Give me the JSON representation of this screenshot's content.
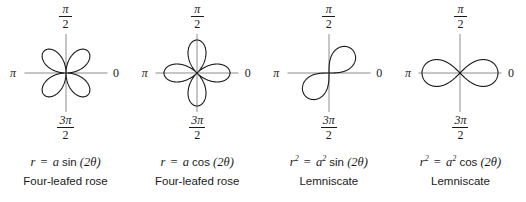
{
  "figure": {
    "axis_color": "#8c8c8c",
    "curve_color": "#1a1a1a",
    "background": "#ffffff"
  },
  "labels": {
    "top_numerator": "π",
    "top_denominator": "2",
    "bottom_numerator": "3π",
    "bottom_denominator": "2",
    "left": "π",
    "right": "0"
  },
  "panels": [
    {
      "id": "four-leafed-rose-sin",
      "equation": {
        "lhs": "r",
        "lhs_sup": "",
        "equals": "=",
        "coefficient": "a",
        "coefficient_sup": "",
        "function": "sin",
        "argument": "(2θ)"
      },
      "name": "Four-leafed rose",
      "curve": {
        "type": "rose",
        "k": 2,
        "phase": "sin",
        "amplitude": 31,
        "petal_count": 4,
        "petal_angles_deg": [
          45,
          135,
          225,
          315
        ]
      }
    },
    {
      "id": "four-leafed-rose-cos",
      "equation": {
        "lhs": "r",
        "lhs_sup": "",
        "equals": "=",
        "coefficient": "a",
        "coefficient_sup": "",
        "function": "cos",
        "argument": "(2θ)"
      },
      "name": "Four-leafed rose",
      "curve": {
        "type": "rose",
        "k": 2,
        "phase": "cos",
        "amplitude": 33,
        "petal_count": 4,
        "petal_angles_deg": [
          0,
          90,
          180,
          270
        ]
      }
    },
    {
      "id": "lemniscate-sin",
      "equation": {
        "lhs": "r",
        "lhs_sup": "2",
        "equals": "=",
        "coefficient": "a",
        "coefficient_sup": "2",
        "function": "sin",
        "argument": "(2θ)"
      },
      "name": "Lemniscate",
      "curve": {
        "type": "lemniscate",
        "phase": "sin",
        "amplitude": 33,
        "rotation_deg": 45,
        "lobe_count": 2
      }
    },
    {
      "id": "lemniscate-cos",
      "equation": {
        "lhs": "r",
        "lhs_sup": "2",
        "equals": "=",
        "coefficient": "a",
        "coefficient_sup": "2",
        "function": "cos",
        "argument": "(2θ)"
      },
      "name": "Lemniscate",
      "curve": {
        "type": "lemniscate",
        "phase": "cos",
        "amplitude": 38,
        "rotation_deg": 0,
        "lobe_count": 2
      }
    }
  ]
}
